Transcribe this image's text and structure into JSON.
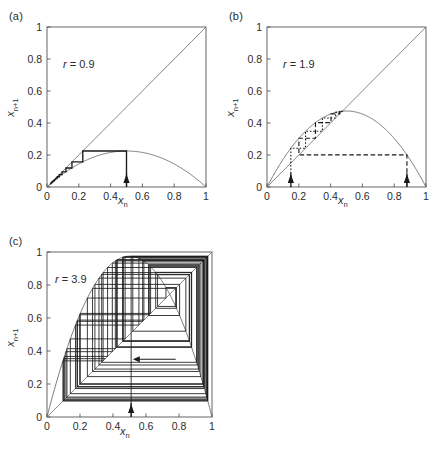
{
  "figure": {
    "axis_label_x": "x",
    "axis_label_x_sub": "n",
    "axis_label_y": "x",
    "axis_label_y_sub": "n+1",
    "tick_labels_x": [
      "0",
      "0.2",
      "0.4",
      "0.6",
      "0.8",
      "1"
    ],
    "tick_labels_y": [
      "0",
      "0.2",
      "0.4",
      "0.6",
      "0.8",
      "1"
    ],
    "line_color": "#4d4d4d",
    "curve_color": "#6b6b6b",
    "orbit_color": "#1a1a1a",
    "frame_color": "#555555",
    "background": "#ffffff"
  },
  "panels": [
    {
      "id": "a",
      "label": "(a)",
      "r_label_prefix": "r",
      "r_label_eq": "=",
      "r_value": "0.9",
      "r_numeric": 0.9,
      "x0": 0.5,
      "arrow_x": [
        0.5
      ]
    },
    {
      "id": "b",
      "label": "(b)",
      "r_label_prefix": "r",
      "r_label_eq": "=",
      "r_value": "1.9",
      "r_numeric": 1.9,
      "x0": 0.15,
      "x0_second": 0.88,
      "arrow_x": [
        0.15,
        0.88
      ]
    },
    {
      "id": "c",
      "label": "(c)",
      "r_label_prefix": "r",
      "r_label_eq": "=",
      "r_value": "3.9",
      "r_numeric": 3.9,
      "x0": 0.51,
      "arrow_x": [
        0.51
      ],
      "inner_arrow": {
        "from_x": 0.78,
        "to_x": 0.52,
        "y": 0.35,
        "direction": "left"
      }
    }
  ],
  "chart_data": {
    "type": "line",
    "title": "",
    "xlabel": "x_n",
    "ylabel": "x_{n+1}",
    "xlim": [
      0,
      1
    ],
    "ylim": [
      0,
      1
    ],
    "xticks": [
      0,
      0.2,
      0.4,
      0.6,
      0.8,
      1
    ],
    "yticks": [
      0,
      0.2,
      0.4,
      0.6,
      0.8,
      1
    ],
    "grid": false,
    "legend": null,
    "subplots": [
      {
        "panel": "a",
        "annotation": "r = 0.9",
        "series": [
          {
            "name": "logistic map",
            "equation": "x_{n+1} = r*x_n*(1-x_n)",
            "r": 0.9,
            "style": "solid-thin",
            "peak_value": 0.225
          },
          {
            "name": "diagonal",
            "equation": "x_{n+1} = x_n",
            "style": "solid-thin"
          },
          {
            "name": "cobweb orbit",
            "x0": 0.5,
            "style": "solid-thick",
            "converges_to": 0.0
          }
        ],
        "arrows": [
          {
            "x": 0.5,
            "y": 0,
            "direction": "up"
          }
        ]
      },
      {
        "panel": "b",
        "annotation": "r = 1.9",
        "series": [
          {
            "name": "logistic map",
            "equation": "x_{n+1} = r*x_n*(1-x_n)",
            "r": 1.9,
            "style": "solid-thin",
            "peak_value": 0.475
          },
          {
            "name": "diagonal",
            "equation": "x_{n+1} = x_n",
            "style": "solid-thin"
          },
          {
            "name": "cobweb orbit 1",
            "x0": 0.15,
            "style": "dotted",
            "converges_to": 0.4737
          },
          {
            "name": "cobweb orbit 2",
            "x0": 0.88,
            "style": "dashed",
            "converges_to": 0.4737
          }
        ],
        "arrows": [
          {
            "x": 0.15,
            "y": 0,
            "direction": "up"
          },
          {
            "x": 0.88,
            "y": 0,
            "direction": "up"
          }
        ]
      },
      {
        "panel": "c",
        "annotation": "r = 3.9",
        "series": [
          {
            "name": "logistic map",
            "equation": "x_{n+1} = r*x_n*(1-x_n)",
            "r": 3.9,
            "style": "solid-thin",
            "peak_value": 0.975
          },
          {
            "name": "diagonal",
            "equation": "x_{n+1} = x_n",
            "style": "solid-thin"
          },
          {
            "name": "cobweb orbit",
            "x0": 0.51,
            "style": "solid-thin",
            "behavior": "chaotic"
          }
        ],
        "arrows": [
          {
            "x": 0.51,
            "y": 0,
            "direction": "up"
          },
          {
            "x_from": 0.78,
            "x_to": 0.52,
            "y": 0.35,
            "direction": "left"
          }
        ]
      }
    ]
  }
}
